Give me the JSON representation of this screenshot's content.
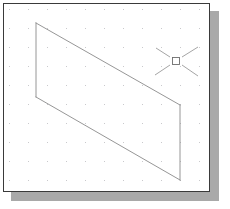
{
  "window": {
    "name": "drawing-window",
    "background_color": "#ffffff",
    "border_color": "#3a3a3a",
    "shadow_color": "#a9a9a9",
    "x": 3,
    "y": 3,
    "width": 207,
    "height": 189
  },
  "grid": {
    "visible": true,
    "dot_color": "#c9c9cc",
    "spacing_x": 19,
    "spacing_y": 19,
    "origin_x": 9,
    "origin_y": 9,
    "dot_size": 1
  },
  "drawing": {
    "shape_name": "parallelogram",
    "edge_color": "#8a8a8a",
    "edge_width": 0.9,
    "closed": true,
    "vertices": [
      {
        "label": "top-left",
        "x": 36,
        "y": 23
      },
      {
        "label": "top-right",
        "x": 180,
        "y": 105
      },
      {
        "label": "bottom-right",
        "x": 180,
        "y": 180
      },
      {
        "label": "bottom-left",
        "x": 36,
        "y": 97
      }
    ],
    "edges": [
      {
        "name": "top-edge",
        "from": 0,
        "to": 1
      },
      {
        "name": "right-edge",
        "from": 1,
        "to": 2
      },
      {
        "name": "bottom-edge",
        "from": 2,
        "to": 3
      },
      {
        "name": "left-edge",
        "from": 3,
        "to": 0
      }
    ]
  },
  "cursor": {
    "type": "crosshair-pickbox",
    "center_x": 176,
    "center_y": 61,
    "arm_color": "#9a9a9a",
    "pickbox_color": "#6e6e6e",
    "pickbox_size": 7,
    "arms": [
      {
        "name": "cursor-arm-upper-left",
        "x1": 156,
        "y1": 48,
        "x2": 170,
        "y2": 57
      },
      {
        "name": "cursor-arm-upper-right",
        "x1": 182,
        "y1": 57,
        "x2": 198,
        "y2": 47
      },
      {
        "name": "cursor-arm-lower-left",
        "x1": 155,
        "y1": 75,
        "x2": 170,
        "y2": 65
      },
      {
        "name": "cursor-arm-lower-right",
        "x1": 182,
        "y1": 65,
        "x2": 198,
        "y2": 76
      }
    ]
  }
}
